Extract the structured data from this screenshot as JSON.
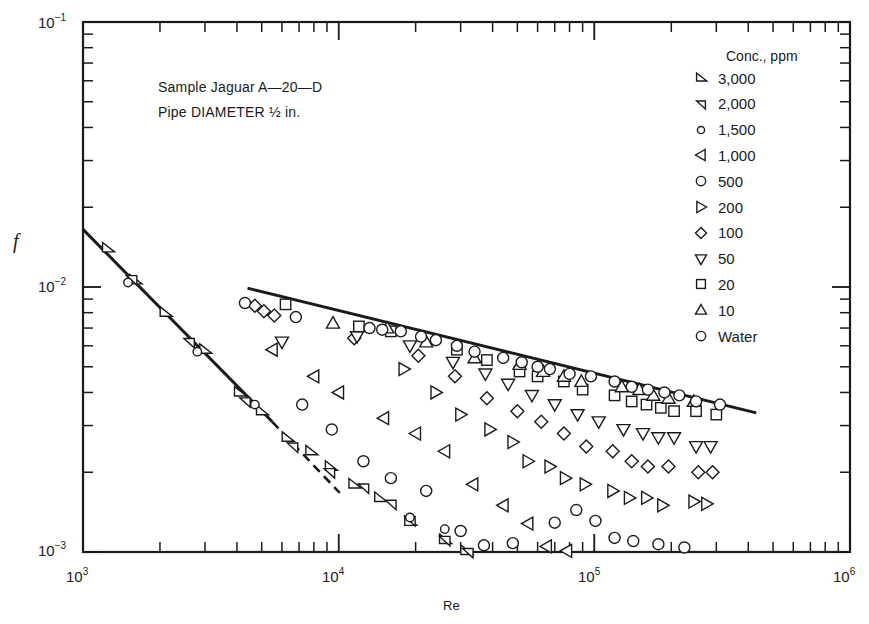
{
  "chart_data": {
    "type": "scatter",
    "title": "",
    "annotations": [
      "Sample Jaguar A-20-D",
      "Pipe DIAMETER ½ in."
    ],
    "xlabel": "Re",
    "ylabel": "f",
    "xscale": "log",
    "yscale": "log",
    "xlim": [
      1000,
      1000000
    ],
    "ylim": [
      0.001,
      0.1
    ],
    "x_tick_labels": [
      "10^3",
      "10^4",
      "10^5",
      "10^6"
    ],
    "y_tick_labels": [
      "10^-3",
      "10^-2",
      "10^-1"
    ],
    "grid": false,
    "legend_title": "Conc., ppm",
    "legend_position": "upper right",
    "lines": [
      {
        "name": "laminar (16/Re)",
        "style": "solid",
        "points": [
          [
            1000,
            0.0165
          ],
          [
            5500,
            0.0031
          ]
        ]
      },
      {
        "name": "laminar extrapolation",
        "style": "dashed",
        "points": [
          [
            5500,
            0.0031
          ],
          [
            10100,
            0.00167
          ]
        ]
      },
      {
        "name": "turbulent (water)",
        "style": "solid",
        "points": [
          [
            4400,
            0.0099
          ],
          [
            430000,
            0.00335
          ]
        ]
      }
    ],
    "series": [
      {
        "name": "3,000",
        "marker": "triangle-right-tilted",
        "points": [
          [
            1250,
            0.014
          ],
          [
            1600,
            0.0106
          ],
          [
            2100,
            0.008
          ],
          [
            3000,
            0.0058
          ],
          [
            4100,
            0.004
          ],
          [
            5000,
            0.0034
          ],
          [
            6300,
            0.0027
          ],
          [
            7800,
            0.0024
          ],
          [
            9300,
            0.0021
          ],
          [
            11500,
            0.0018
          ],
          [
            14500,
            0.0016
          ],
          [
            19000,
            0.0013
          ],
          [
            26000,
            0.00111
          ],
          [
            31500,
            0.00101
          ]
        ]
      },
      {
        "name": "2,000",
        "marker": "triangle-down-left",
        "points": [
          [
            1550,
            0.0107
          ],
          [
            2600,
            0.0062
          ],
          [
            4300,
            0.0037
          ],
          [
            6600,
            0.0025
          ],
          [
            9200,
            0.002
          ],
          [
            12500,
            0.00175
          ],
          [
            16000,
            0.00152
          ],
          [
            19000,
            0.00132
          ],
          [
            26000,
            0.00111
          ],
          [
            32000,
            0.001
          ]
        ]
      },
      {
        "name": "1,500",
        "marker": "circle-small",
        "points": [
          [
            1500,
            0.0104
          ],
          [
            2800,
            0.0057
          ],
          [
            4700,
            0.0036
          ],
          [
            19000,
            0.00135
          ],
          [
            26000,
            0.00122
          ]
        ]
      },
      {
        "name": "1,000",
        "marker": "triangle-left",
        "points": [
          [
            5500,
            0.0058
          ],
          [
            8000,
            0.0046
          ],
          [
            10000,
            0.004
          ],
          [
            15000,
            0.0032
          ],
          [
            20000,
            0.0028
          ],
          [
            26000,
            0.0024
          ],
          [
            33500,
            0.0018
          ],
          [
            44000,
            0.0015
          ],
          [
            55000,
            0.00128
          ],
          [
            65000,
            0.00105
          ],
          [
            78000,
            0.00101
          ]
        ]
      },
      {
        "name": "500",
        "marker": "circle",
        "points": [
          [
            7200,
            0.0036
          ],
          [
            9400,
            0.0029
          ],
          [
            12500,
            0.0022
          ],
          [
            16000,
            0.0019
          ],
          [
            22000,
            0.0017
          ],
          [
            30000,
            0.0012
          ],
          [
            37000,
            0.00106
          ],
          [
            48000,
            0.00108
          ],
          [
            70000,
            0.00129
          ],
          [
            85000,
            0.00144
          ],
          [
            101000,
            0.00131
          ],
          [
            120000,
            0.00113
          ],
          [
            142000,
            0.0011
          ],
          [
            178000,
            0.00107
          ],
          [
            225000,
            0.00104
          ]
        ]
      },
      {
        "name": "200",
        "marker": "triangle-right",
        "points": [
          [
            18000,
            0.0049
          ],
          [
            24000,
            0.004
          ],
          [
            30000,
            0.0033
          ],
          [
            39000,
            0.0029
          ],
          [
            48000,
            0.0026
          ],
          [
            55000,
            0.0022
          ],
          [
            67000,
            0.0021
          ],
          [
            77000,
            0.0019
          ],
          [
            92000,
            0.0018
          ],
          [
            118000,
            0.0017
          ],
          [
            137000,
            0.0016
          ],
          [
            160000,
            0.0016
          ],
          [
            185000,
            0.0015
          ],
          [
            245000,
            0.00155
          ],
          [
            275000,
            0.00152
          ]
        ]
      },
      {
        "name": "100",
        "marker": "diamond",
        "points": [
          [
            4700,
            0.0085
          ],
          [
            5100,
            0.0081
          ],
          [
            5600,
            0.0078
          ],
          [
            11500,
            0.0064
          ],
          [
            20500,
            0.0055
          ],
          [
            28500,
            0.0046
          ],
          [
            38000,
            0.0038
          ],
          [
            50000,
            0.0034
          ],
          [
            62000,
            0.0031
          ],
          [
            76000,
            0.0028
          ],
          [
            93000,
            0.0025
          ],
          [
            118000,
            0.0024
          ],
          [
            140000,
            0.0022
          ],
          [
            162000,
            0.0021
          ],
          [
            195000,
            0.0021
          ],
          [
            255000,
            0.002
          ],
          [
            290000,
            0.002
          ]
        ]
      },
      {
        "name": "50",
        "marker": "triangle-down",
        "points": [
          [
            6000,
            0.0062
          ],
          [
            11800,
            0.0065
          ],
          [
            19000,
            0.006
          ],
          [
            28000,
            0.0052
          ],
          [
            37500,
            0.0047
          ],
          [
            46000,
            0.0043
          ],
          [
            57000,
            0.0039
          ],
          [
            70000,
            0.0036
          ],
          [
            86000,
            0.0033
          ],
          [
            104000,
            0.0031
          ],
          [
            130000,
            0.0029
          ],
          [
            155000,
            0.0028
          ],
          [
            178000,
            0.0027
          ],
          [
            205000,
            0.0027
          ],
          [
            250000,
            0.0025
          ],
          [
            285000,
            0.0025
          ]
        ]
      },
      {
        "name": "20",
        "marker": "square",
        "points": [
          [
            6200,
            0.0086
          ],
          [
            12000,
            0.0071
          ],
          [
            16000,
            0.0068
          ],
          [
            29000,
            0.0058
          ],
          [
            38000,
            0.0053
          ],
          [
            51000,
            0.0048
          ],
          [
            60000,
            0.0046
          ],
          [
            76000,
            0.0044
          ],
          [
            90000,
            0.0041
          ],
          [
            120000,
            0.0039
          ],
          [
            140000,
            0.0037
          ],
          [
            160000,
            0.0036
          ],
          [
            182000,
            0.0035
          ],
          [
            205000,
            0.0034
          ],
          [
            250000,
            0.0034
          ],
          [
            300000,
            0.0033
          ]
        ]
      },
      {
        "name": "10",
        "marker": "triangle-up",
        "points": [
          [
            9500,
            0.0073
          ],
          [
            15500,
            0.007
          ],
          [
            22000,
            0.0062
          ],
          [
            34000,
            0.0054
          ],
          [
            51000,
            0.0051
          ],
          [
            63000,
            0.0048
          ],
          [
            76000,
            0.0046
          ],
          [
            89000,
            0.0044
          ],
          [
            128000,
            0.0042
          ],
          [
            150000,
            0.0041
          ],
          [
            170000,
            0.0039
          ],
          [
            195000,
            0.0038
          ],
          [
            245000,
            0.0037
          ]
        ]
      },
      {
        "name": "Water",
        "marker": "circle",
        "points": [
          [
            4300,
            0.0087
          ],
          [
            6800,
            0.0077
          ],
          [
            13200,
            0.007
          ],
          [
            14800,
            0.0069
          ],
          [
            17500,
            0.0068
          ],
          [
            21000,
            0.0065
          ],
          [
            24000,
            0.0063
          ],
          [
            29000,
            0.006
          ],
          [
            34000,
            0.0057
          ],
          [
            44000,
            0.0054
          ],
          [
            52000,
            0.0052
          ],
          [
            60000,
            0.005
          ],
          [
            67000,
            0.0049
          ],
          [
            80000,
            0.0047
          ],
          [
            97000,
            0.0046
          ],
          [
            120000,
            0.0044
          ],
          [
            140000,
            0.0042
          ],
          [
            162000,
            0.0041
          ],
          [
            188000,
            0.004
          ],
          [
            215000,
            0.0039
          ],
          [
            250000,
            0.0037
          ],
          [
            310000,
            0.0036
          ]
        ]
      }
    ]
  },
  "labels": {
    "annotation_line1": "Sample Jaguar  A—20—D",
    "annotation_line2": "Pipe DIAMETER ½ in.",
    "legend_title": "Conc.,  ppm",
    "xlabel": "Re",
    "ylabel": "f",
    "x_ticks": [
      {
        "base": "10",
        "exp": "3"
      },
      {
        "base": "10",
        "exp": "4"
      },
      {
        "base": "10",
        "exp": "5"
      },
      {
        "base": "10",
        "exp": "6"
      }
    ],
    "y_ticks": [
      {
        "base": "10",
        "exp": "−3"
      },
      {
        "base": "10",
        "exp": "−2"
      },
      {
        "base": "10",
        "exp": "−1"
      }
    ],
    "legend": [
      {
        "label": "3,000",
        "marker": "triangle-right-tilted"
      },
      {
        "label": "2,000",
        "marker": "triangle-down-left"
      },
      {
        "label": "1,500",
        "marker": "circle-small"
      },
      {
        "label": "1,000",
        "marker": "triangle-left"
      },
      {
        "label": "500",
        "marker": "circle"
      },
      {
        "label": "200",
        "marker": "triangle-right"
      },
      {
        "label": "100",
        "marker": "diamond"
      },
      {
        "label": "50",
        "marker": "triangle-down"
      },
      {
        "label": "20",
        "marker": "square"
      },
      {
        "label": "10",
        "marker": "triangle-up"
      },
      {
        "label": "Water",
        "marker": "circle"
      }
    ]
  },
  "colors": {
    "ink": "#1a1a1a",
    "background": "#ffffff"
  }
}
